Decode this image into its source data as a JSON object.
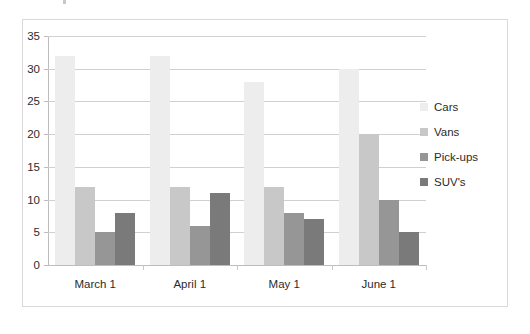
{
  "chart_data": {
    "type": "bar",
    "title": "",
    "xlabel": "",
    "ylabel": "",
    "categories": [
      "March 1",
      "April 1",
      "May 1",
      "June 1"
    ],
    "series": [
      {
        "name": "Cars",
        "values": [
          32,
          32,
          28,
          30
        ],
        "color": "#EDEDED"
      },
      {
        "name": "Vans",
        "values": [
          12,
          12,
          12,
          20
        ],
        "color": "#C8C8C8"
      },
      {
        "name": "Pick-ups",
        "values": [
          5,
          6,
          8,
          10
        ],
        "color": "#969696"
      },
      {
        "name": "SUV's",
        "values": [
          8,
          11,
          7,
          5
        ],
        "color": "#7A7A7A"
      }
    ],
    "ylim": [
      0,
      35
    ],
    "yticks": [
      0,
      5,
      10,
      15,
      20,
      25,
      30,
      35
    ],
    "ytick_labels": [
      "0",
      "5",
      "10",
      "15",
      "20",
      "25",
      "30",
      "35"
    ],
    "grid": "horizontal",
    "legend_position": "right",
    "annotations": []
  },
  "style": {
    "border_color": "#d9d9d9",
    "gridline_color": "#d0d0d0",
    "axis_color": "#bdbdbd",
    "text_color": "#2b2b2b",
    "background": "#ffffff"
  }
}
